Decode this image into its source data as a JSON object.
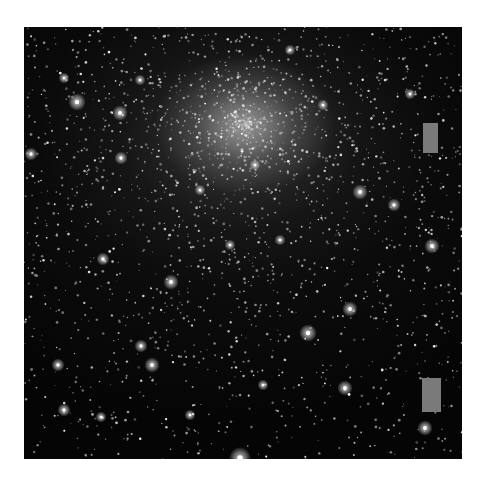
{
  "image": {
    "subject": "globular star cluster",
    "frame": {
      "x": 24,
      "y": 27,
      "width": 438,
      "height": 432,
      "background": "#050505"
    },
    "cluster_core": {
      "cx": 245,
      "cy": 125
    },
    "masks": [
      {
        "name": "mask-upper-right",
        "x": 423,
        "y": 123,
        "width": 15,
        "height": 30,
        "color": "#7a7a7a"
      },
      {
        "name": "mask-lower-right",
        "x": 422,
        "y": 378,
        "width": 19,
        "height": 34,
        "color": "#7a7a7a"
      }
    ],
    "bright_stars": [
      {
        "x": 77,
        "y": 102,
        "r": 4
      },
      {
        "x": 120,
        "y": 113,
        "r": 3.5
      },
      {
        "x": 31,
        "y": 154,
        "r": 3
      },
      {
        "x": 64,
        "y": 78,
        "r": 2.5
      },
      {
        "x": 140,
        "y": 80,
        "r": 2.5
      },
      {
        "x": 121,
        "y": 158,
        "r": 3
      },
      {
        "x": 360,
        "y": 192,
        "r": 3.5
      },
      {
        "x": 394,
        "y": 205,
        "r": 3
      },
      {
        "x": 432,
        "y": 246,
        "r": 3.5
      },
      {
        "x": 308,
        "y": 333,
        "r": 4
      },
      {
        "x": 350,
        "y": 309,
        "r": 3.5
      },
      {
        "x": 345,
        "y": 388,
        "r": 3.5
      },
      {
        "x": 240,
        "y": 458,
        "r": 5
      },
      {
        "x": 171,
        "y": 282,
        "r": 3.5
      },
      {
        "x": 103,
        "y": 259,
        "r": 3
      },
      {
        "x": 141,
        "y": 346,
        "r": 3
      },
      {
        "x": 152,
        "y": 365,
        "r": 3.5
      },
      {
        "x": 58,
        "y": 365,
        "r": 3
      },
      {
        "x": 64,
        "y": 410,
        "r": 3
      },
      {
        "x": 101,
        "y": 417,
        "r": 2.5
      },
      {
        "x": 425,
        "y": 428,
        "r": 3.5
      },
      {
        "x": 410,
        "y": 94,
        "r": 2.5
      },
      {
        "x": 290,
        "y": 50,
        "r": 2.5
      },
      {
        "x": 323,
        "y": 105,
        "r": 2.5
      },
      {
        "x": 255,
        "y": 165,
        "r": 2.5
      },
      {
        "x": 200,
        "y": 190,
        "r": 2.5
      },
      {
        "x": 230,
        "y": 245,
        "r": 2.5
      },
      {
        "x": 280,
        "y": 240,
        "r": 2.5
      },
      {
        "x": 263,
        "y": 385,
        "r": 2.5
      },
      {
        "x": 190,
        "y": 415,
        "r": 2.5
      }
    ],
    "field_star_seed": 1337,
    "field_star_count": 2600
  }
}
